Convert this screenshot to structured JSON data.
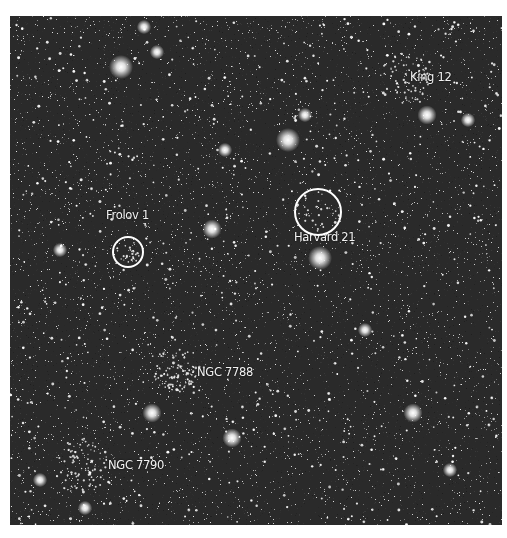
{
  "image": {
    "frame": {
      "left": 10,
      "top": 16,
      "width": 492,
      "height": 509,
      "background": "#2a2a2a",
      "border_color": "#ffffff"
    },
    "starfield": {
      "faint_count": 4200,
      "medium_count": 650,
      "seed": 7788
    }
  },
  "clusters": [
    {
      "name": "King 12",
      "label_x": 410,
      "label_y": 78,
      "circle": null
    },
    {
      "name": "Frolov 1",
      "label_x": 106,
      "label_y": 216,
      "circle": {
        "cx": 128,
        "cy": 252,
        "r": 16
      }
    },
    {
      "name": "Harvard 21",
      "label_x": 294,
      "label_y": 238,
      "circle": {
        "cx": 318,
        "cy": 212,
        "r": 24
      }
    },
    {
      "name": "NGC 7788",
      "label_x": 197,
      "label_y": 373,
      "circle": null
    },
    {
      "name": "NGC 7790",
      "label_x": 108,
      "label_y": 466,
      "circle": null
    }
  ],
  "bright_stars": [
    {
      "x": 121,
      "y": 67,
      "size": 5
    },
    {
      "x": 157,
      "y": 52,
      "size": 3
    },
    {
      "x": 288,
      "y": 140,
      "size": 5
    },
    {
      "x": 305,
      "y": 115,
      "size": 3
    },
    {
      "x": 427,
      "y": 115,
      "size": 4
    },
    {
      "x": 212,
      "y": 229,
      "size": 4
    },
    {
      "x": 320,
      "y": 258,
      "size": 5
    },
    {
      "x": 413,
      "y": 413,
      "size": 4
    },
    {
      "x": 232,
      "y": 438,
      "size": 4
    },
    {
      "x": 152,
      "y": 413,
      "size": 4
    },
    {
      "x": 144,
      "y": 27,
      "size": 3
    },
    {
      "x": 225,
      "y": 150,
      "size": 3
    },
    {
      "x": 468,
      "y": 120,
      "size": 3
    },
    {
      "x": 40,
      "y": 480,
      "size": 3
    },
    {
      "x": 85,
      "y": 508,
      "size": 3
    },
    {
      "x": 450,
      "y": 470,
      "size": 3
    },
    {
      "x": 365,
      "y": 330,
      "size": 3
    },
    {
      "x": 60,
      "y": 250,
      "size": 3
    }
  ],
  "star_clusters_density": [
    {
      "cx": 175,
      "cy": 370,
      "r": 22,
      "count": 90
    },
    {
      "cx": 80,
      "cy": 466,
      "r": 28,
      "count": 90
    },
    {
      "cx": 405,
      "cy": 78,
      "r": 25,
      "count": 70
    },
    {
      "cx": 128,
      "cy": 252,
      "r": 12,
      "count": 25
    },
    {
      "cx": 318,
      "cy": 212,
      "r": 20,
      "count": 25
    }
  ]
}
